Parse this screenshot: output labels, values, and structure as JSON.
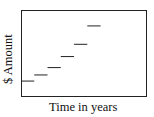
{
  "chart_data": {
    "type": "line",
    "subtype": "step-segments",
    "title": "",
    "xlabel": "Time in years",
    "ylabel": "$ Amount",
    "grid": false,
    "legend": null,
    "x_ticks": [],
    "y_ticks": [],
    "segments": [
      {
        "x_start": 0,
        "x_end": 1,
        "y": 1.0
      },
      {
        "x_start": 1,
        "x_end": 2,
        "y": 1.5
      },
      {
        "x_start": 2,
        "x_end": 3,
        "y": 2.1
      },
      {
        "x_start": 3,
        "x_end": 4,
        "y": 3.0
      },
      {
        "x_start": 4,
        "x_end": 5,
        "y": 4.0
      },
      {
        "x_start": 5,
        "x_end": 6,
        "y": 5.5
      }
    ],
    "xlim": [
      0,
      9.5
    ],
    "ylim": [
      -0.3,
      6.8
    ]
  },
  "colors": {
    "line": "#222222",
    "background": "#ffffff"
  }
}
